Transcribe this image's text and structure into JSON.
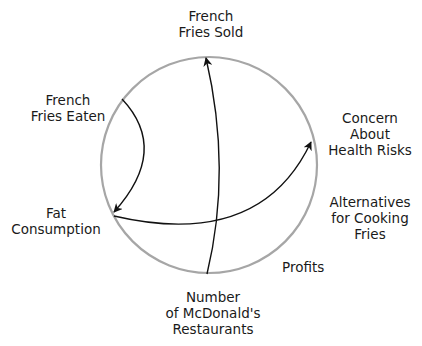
{
  "diagram": {
    "type": "causal-circle",
    "circle_color": "#a6a6a6",
    "arrow_color": "#111111",
    "nodes": {
      "french_fries_sold": {
        "lines": [
          "French",
          "Fries Sold"
        ]
      },
      "french_fries_eaten": {
        "lines": [
          "French",
          "Fries Eaten"
        ]
      },
      "concern_health": {
        "lines": [
          "Concern",
          "About",
          "Health Risks"
        ]
      },
      "fat_consumption": {
        "lines": [
          "Fat",
          "Consumption"
        ]
      },
      "alternatives": {
        "lines": [
          "Alternatives",
          "for Cooking",
          "Fries"
        ]
      },
      "profits": {
        "lines": [
          "Profits"
        ]
      },
      "mcdonalds": {
        "lines": [
          "Number",
          "of McDonald's",
          "Restaurants"
        ]
      }
    },
    "edges": [
      {
        "from": "Number of McDonald's Restaurants",
        "to": "French Fries Sold"
      },
      {
        "from": "French Fries Eaten",
        "to": "Fat Consumption"
      },
      {
        "from": "Fat Consumption",
        "to": "Concern About Health Risks"
      }
    ]
  }
}
